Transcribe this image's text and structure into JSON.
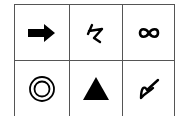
{
  "grid": {
    "rows": 2,
    "cols": 3,
    "cells": [
      {
        "row": 0,
        "col": 0,
        "symbol": "right-arrow-icon"
      },
      {
        "row": 0,
        "col": 1,
        "symbol": "handwritten-glyph-icon"
      },
      {
        "row": 0,
        "col": 2,
        "symbol": "infinity-icon"
      },
      {
        "row": 1,
        "col": 0,
        "symbol": "double-circle-icon"
      },
      {
        "row": 1,
        "col": 1,
        "symbol": "filled-triangle-icon"
      },
      {
        "row": 1,
        "col": 2,
        "symbol": "scribble-glyph-icon"
      }
    ],
    "line_color": "#555555",
    "symbol_color": "#000000"
  }
}
